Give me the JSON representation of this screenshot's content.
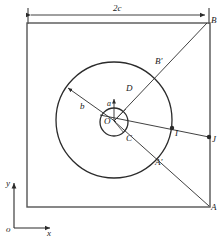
{
  "figure": {
    "stroke_color": "#2b2b2b",
    "background": "#ffffff"
  },
  "dimension": {
    "label": "2c",
    "span_start_x": 28,
    "span_end_x": 209,
    "y": 15
  },
  "square": {
    "left": 27,
    "top": 23,
    "right": 210,
    "bottom": 207
  },
  "circles": {
    "outer": {
      "cx": 114,
      "cy": 120,
      "r": 58,
      "radius_label": "b"
    },
    "inner": {
      "cx": 114,
      "cy": 122,
      "r": 14,
      "radius_label": "a"
    }
  },
  "points": [
    {
      "name": "B",
      "label": "B",
      "x": 207,
      "y": 22,
      "lx": 211,
      "ly": 18,
      "dot": false
    },
    {
      "name": "Bp",
      "label": "B'",
      "x": 152,
      "y": 71,
      "lx": 155,
      "ly": 58,
      "dot": false
    },
    {
      "name": "D",
      "label": "D",
      "x": 124,
      "y": 110,
      "lx": 126,
      "ly": 85,
      "dot": false
    },
    {
      "name": "O",
      "label": "O",
      "x": 114,
      "y": 122,
      "lx": 106,
      "ly": 118,
      "dot": false
    },
    {
      "name": "C",
      "label": "C",
      "x": 124,
      "y": 132,
      "lx": 126,
      "ly": 136,
      "dot": false
    },
    {
      "name": "I",
      "label": "I",
      "x": 172,
      "y": 128,
      "lx": 175,
      "ly": 130,
      "dot": true
    },
    {
      "name": "J",
      "label": "J",
      "x": 210,
      "y": 137,
      "lx": 213,
      "ly": 138,
      "dot": true
    },
    {
      "name": "Ap",
      "label": "A'",
      "x": 152,
      "y": 163,
      "lx": 155,
      "ly": 159,
      "dot": false
    },
    {
      "name": "A",
      "label": "A",
      "x": 210,
      "y": 207,
      "lx": 212,
      "ly": 205,
      "dot": false
    }
  ],
  "axes": {
    "origin_label": "o",
    "x_label": "x",
    "y_label": "y",
    "origin_x": 14,
    "origin_y": 228,
    "x_end": 52,
    "y_end": 180
  },
  "lines": {
    "diagonal_label": "A-to-B diagonal",
    "secant_label": "O-to-J secant"
  }
}
